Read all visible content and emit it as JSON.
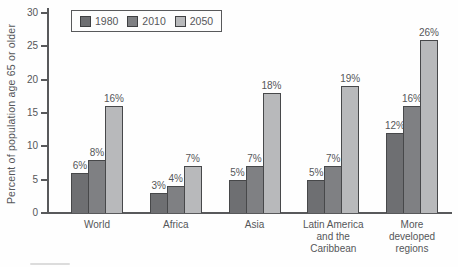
{
  "chart_data": {
    "type": "bar",
    "title": "",
    "xlabel": "",
    "ylabel": "Percent of population age 65 or older",
    "ylim": [
      0,
      30
    ],
    "yticks": [
      0,
      5,
      10,
      15,
      20,
      25,
      30
    ],
    "grid": false,
    "legend_position": "top-left",
    "value_label_suffix": "%",
    "categories": [
      "World",
      "Africa",
      "Asia",
      "Latin America and the Caribbean",
      "More developed regions"
    ],
    "series": [
      {
        "name": "1980",
        "color": "#6e6f72",
        "values": [
          6,
          3,
          5,
          5,
          12
        ]
      },
      {
        "name": "2010",
        "color": "#7f8083",
        "values": [
          8,
          4,
          7,
          7,
          16
        ]
      },
      {
        "name": "2050",
        "color": "#b8b9bb",
        "values": [
          16,
          7,
          18,
          19,
          26
        ]
      }
    ]
  },
  "colors": {
    "axis": "#58595b",
    "text": "#555659",
    "background": "#fefefe",
    "bar_border": "#47484a"
  }
}
